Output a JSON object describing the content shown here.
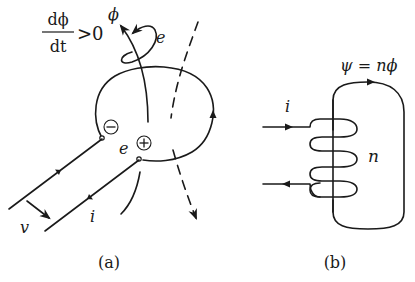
{
  "figure_a": {
    "caption": "(a)",
    "rate_condition": {
      "numerator": "dϕ",
      "denominator": "dt",
      "relation": ">0"
    },
    "flux_label": "ϕ",
    "emf_label_top": "e",
    "emf_label_terminals": "e",
    "negative_terminal": "−",
    "positive_terminal": "+",
    "velocity_label": "v",
    "current_label": "i"
  },
  "figure_b": {
    "caption": "(b)",
    "flux_linkage_equation": "ψ = nϕ",
    "current_label": "i",
    "turns_label": "n"
  },
  "colors": {
    "ink": "#1a1a1a",
    "background": "#ffffff"
  }
}
